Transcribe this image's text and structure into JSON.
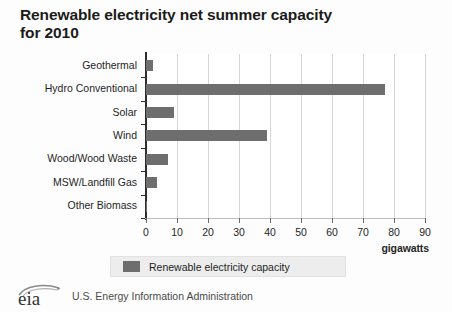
{
  "title": "Renewable electricity net summer\ncapacity for 2010",
  "colors": {
    "bar": "#6e6e6e",
    "gridline": "#d6d6d6",
    "axis": "#2d2d2d",
    "legend_background": "#ededed",
    "background": "#fdfdfd"
  },
  "chart_data": {
    "type": "bar",
    "orientation": "horizontal",
    "title": "Renewable electricity net summer capacity for 2010",
    "categories": [
      "Geothermal",
      "Hydro Conventional",
      "Solar",
      "Wind",
      "Wood/Wood Waste",
      "MSW/Landfill Gas",
      "Other Biomass"
    ],
    "values": [
      2.4,
      77.0,
      9.0,
      39.0,
      7.0,
      3.4,
      0.3
    ],
    "series": [
      {
        "name": "Renewable electricity capacity",
        "values": [
          2.4,
          77.0,
          9.0,
          39.0,
          7.0,
          3.4,
          0.3
        ]
      }
    ],
    "xlabel": "gigawatts",
    "ylabel": "",
    "xlim": [
      0,
      90
    ],
    "xticks": [
      0,
      10,
      20,
      30,
      40,
      50,
      60,
      70,
      80,
      90
    ],
    "xtick_labels": [
      "0",
      "10",
      "20",
      "30",
      "40",
      "50",
      "60",
      "70",
      "80",
      "90"
    ],
    "grid": true,
    "grid_axis": "x",
    "legend": {
      "position": "bottom",
      "entries": [
        "Renewable electricity capacity"
      ]
    }
  },
  "legend": {
    "label": "Renewable electricity capacity"
  },
  "footer": {
    "logo_text": "eia",
    "agency": "U.S. Energy Information Administration"
  }
}
